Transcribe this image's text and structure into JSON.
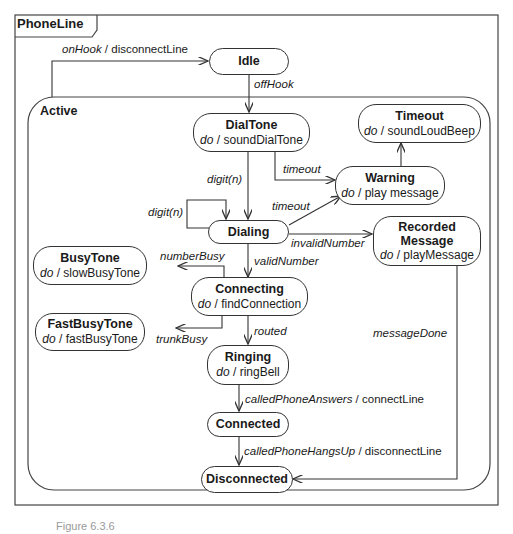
{
  "frame": {
    "title": "PhoneLine"
  },
  "composite": {
    "title": "Active"
  },
  "states": {
    "idle": {
      "name": "Idle"
    },
    "dialtone": {
      "name": "DialTone",
      "do_kw": "do",
      "action": "soundDialTone"
    },
    "timeout": {
      "name": "Timeout",
      "do_kw": "do",
      "action": "soundLoudBeep"
    },
    "warning": {
      "name": "Warning",
      "do_kw": "do",
      "action": "play message"
    },
    "dialing": {
      "name": "Dialing"
    },
    "recorded": {
      "name1": "Recorded",
      "name2": "Message",
      "do_kw": "do",
      "action": "playMessage"
    },
    "busytone": {
      "name": "BusyTone",
      "do_kw": "do",
      "action": "slowBusyTone"
    },
    "connecting": {
      "name": "Connecting",
      "do_kw": "do",
      "action": "findConnection"
    },
    "fastbusy": {
      "name": "FastBusyTone",
      "do_kw": "do",
      "action": "fastBusyTone"
    },
    "ringing": {
      "name": "Ringing",
      "do_kw": "do",
      "action": "ringBell"
    },
    "connected": {
      "name": "Connected"
    },
    "disconnected": {
      "name": "Disconnected"
    }
  },
  "transitions": {
    "onhook_event": "onHook",
    "onhook_action": "/ disconnectLine",
    "offhook": "offHook",
    "digit1": "digit(n)",
    "digit2": "digit(n)",
    "timeout1": "timeout",
    "timeout2": "timeout",
    "invalid": "invalidNumber",
    "valid": "validNumber",
    "busy": "numberBusy",
    "trunk": "trunkBusy",
    "routed": "routed",
    "msgdone": "messageDone",
    "answers_event": "calledPhoneAnswers",
    "answers_action": "/ connectLine",
    "hangs_event": "calledPhoneHangsUp",
    "hangs_action": "/ disconnectLine"
  },
  "caption": "Figure 6.3.6"
}
